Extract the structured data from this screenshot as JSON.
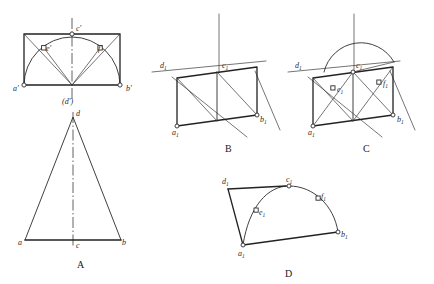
{
  "figure": {
    "captions": [
      {
        "id": "A",
        "label": "A",
        "x": 80,
        "y": 266
      },
      {
        "id": "B",
        "label": "B",
        "x": 228,
        "y": 150
      },
      {
        "id": "C",
        "label": "C",
        "x": 366,
        "y": 150
      },
      {
        "id": "D",
        "label": "D",
        "x": 288,
        "y": 275
      }
    ]
  },
  "views": {
    "front_view": {
      "name": "front-elevation-view",
      "labels": [
        {
          "key": "a_prime",
          "base": "a",
          "prime": "′",
          "x": 13,
          "y": 91
        },
        {
          "key": "b_prime",
          "base": "b",
          "prime": "′",
          "x": 126,
          "y": 91
        },
        {
          "key": "c_prime",
          "base": "c",
          "prime": "′",
          "x": 76,
          "y": 31
        },
        {
          "key": "d_prime",
          "base": "(d",
          "prime": "′)",
          "x": 66,
          "y": 104
        },
        {
          "key": "e_prime",
          "base": "e",
          "prime": "′",
          "x": 46,
          "y": 51
        },
        {
          "key": "f_prime",
          "base": "f",
          "prime": "′",
          "x": 98,
          "y": 51
        }
      ]
    },
    "top_view": {
      "name": "top-plan-view-triangle",
      "labels": [
        {
          "key": "a",
          "base": "a",
          "prime": "",
          "x": 22,
          "y": 245
        },
        {
          "key": "b",
          "base": "b",
          "prime": "",
          "x": 120,
          "y": 245
        },
        {
          "key": "c",
          "base": "c",
          "prime": "",
          "x": 78,
          "y": 246
        },
        {
          "key": "d",
          "base": "d",
          "prime": "",
          "x": 77,
          "y": 119
        }
      ]
    },
    "axonometric_b": {
      "name": "axonometric-view-b",
      "labels": [
        {
          "key": "a1",
          "base": "a",
          "sub": "1",
          "x": 177,
          "y": 131
        },
        {
          "key": "b1",
          "base": "b",
          "sub": "1",
          "x": 264,
          "y": 119
        },
        {
          "key": "c1",
          "base": "c",
          "sub": "1",
          "x": 229,
          "y": 70
        },
        {
          "key": "d1",
          "base": "d",
          "sub": "1",
          "x": 163,
          "y": 66
        }
      ]
    },
    "axonometric_c": {
      "name": "axonometric-view-c",
      "labels": [
        {
          "key": "a1",
          "base": "a",
          "sub": "1",
          "x": 313,
          "y": 131
        },
        {
          "key": "b1",
          "base": "b",
          "sub": "1",
          "x": 409,
          "y": 120
        },
        {
          "key": "c1",
          "base": "c",
          "sub": "1",
          "x": 362,
          "y": 70
        },
        {
          "key": "d1",
          "base": "d",
          "sub": "1",
          "x": 298,
          "y": 66
        },
        {
          "key": "e1",
          "base": "e",
          "sub": "1",
          "x": 338,
          "y": 89
        },
        {
          "key": "f1",
          "base": "f",
          "sub": "1",
          "x": 386,
          "y": 85
        }
      ]
    },
    "surface_d": {
      "name": "developed-surface-view-d",
      "labels": [
        {
          "key": "a1",
          "base": "a",
          "sub": "1",
          "x": 239,
          "y": 255
        },
        {
          "key": "b1",
          "base": "b",
          "sub": "1",
          "x": 341,
          "y": 238
        },
        {
          "key": "c1",
          "base": "c",
          "sub": "1",
          "x": 288,
          "y": 184
        },
        {
          "key": "d1",
          "base": "d",
          "sub": "1",
          "x": 225,
          "y": 182
        },
        {
          "key": "e1",
          "base": "e",
          "sub": "1",
          "x": 260,
          "y": 213
        },
        {
          "key": "f1",
          "base": "f",
          "sub": "1",
          "x": 320,
          "y": 198
        }
      ]
    }
  },
  "colors": {
    "stroke": "#2b2b2b",
    "thin_stroke": "#3a3a3a",
    "background": "#ffffff",
    "node_fill": "#ffffff"
  }
}
